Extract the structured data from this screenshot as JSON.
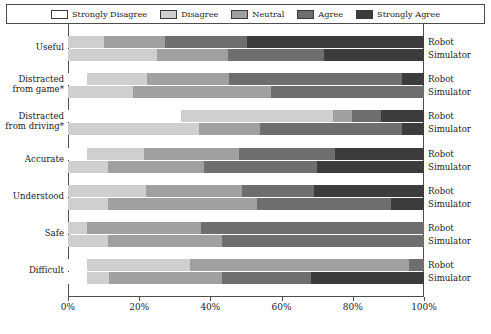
{
  "chart_data": {
    "type": "bar",
    "subtype": "stacked-horizontal-likert",
    "title": "",
    "xlabel": "",
    "ylabel": "",
    "xlim": [
      0,
      100
    ],
    "xticks": [
      "0%",
      "20%",
      "40%",
      "60%",
      "80%",
      "100%"
    ],
    "xtick_values": [
      0,
      20,
      40,
      60,
      80,
      100
    ],
    "grid": false,
    "legend": {
      "position": "top",
      "entries": [
        {
          "label": "Strongly Disagree",
          "color": "#ffffff",
          "key": "sd"
        },
        {
          "label": "Disagree",
          "color": "#cfcfcf",
          "key": "d"
        },
        {
          "label": "Neutral",
          "color": "#a0a0a0",
          "key": "n"
        },
        {
          "label": "Agree",
          "color": "#6e6e6e",
          "key": "a"
        },
        {
          "label": "Strongly Agree",
          "color": "#3c3c3c",
          "key": "sa"
        }
      ]
    },
    "categories": [
      "Useful",
      "Distracted from game*",
      "Distracted from driving*",
      "Accurate",
      "Understood",
      "Safe",
      "Difficult"
    ],
    "series_names": [
      "Robot",
      "Simulator"
    ],
    "groups": [
      {
        "category": "Useful",
        "label_line1": "Useful",
        "label_line2": "",
        "bars": [
          {
            "series": "Robot",
            "values": [
              0,
              10,
              17,
              23,
              50
            ]
          },
          {
            "series": "Simulator",
            "values": [
              0,
              25,
              20,
              27,
              28
            ]
          }
        ]
      },
      {
        "category": "Distracted from game*",
        "label_line1": "Distracted",
        "label_line2": "from game*",
        "bars": [
          {
            "series": "Robot",
            "values": [
              5,
              17,
              23,
              49,
              6
            ]
          },
          {
            "series": "Simulator",
            "values": [
              0,
              18,
              39,
              43,
              0
            ]
          }
        ]
      },
      {
        "category": "Distracted from driving*",
        "label_line1": "Distracted",
        "label_line2": "from driving*",
        "bars": [
          {
            "series": "Robot",
            "values": [
              32,
              43,
              5,
              8,
              12
            ]
          },
          {
            "series": "Simulator",
            "values": [
              0,
              37,
              17,
              40,
              6
            ]
          }
        ]
      },
      {
        "category": "Accurate",
        "label_line1": "Accurate",
        "label_line2": "",
        "bars": [
          {
            "series": "Robot",
            "values": [
              5,
              16,
              27,
              27,
              25
            ]
          },
          {
            "series": "Simulator",
            "values": [
              0,
              11,
              27,
              32,
              30
            ]
          }
        ]
      },
      {
        "category": "Understood",
        "label_line1": "Understood",
        "label_line2": "",
        "bars": [
          {
            "series": "Robot",
            "values": [
              0,
              22,
              27,
              20,
              31
            ]
          },
          {
            "series": "Simulator",
            "values": [
              0,
              11,
              42,
              38,
              9
            ]
          }
        ]
      },
      {
        "category": "Safe",
        "label_line1": "Safe",
        "label_line2": "",
        "bars": [
          {
            "series": "Robot",
            "values": [
              0,
              5,
              32,
              63,
              0
            ]
          },
          {
            "series": "Simulator",
            "values": [
              0,
              11,
              32,
              57,
              0
            ]
          }
        ]
      },
      {
        "category": "Difficult",
        "label_line1": "Difficult",
        "label_line2": "",
        "bars": [
          {
            "series": "Robot",
            "values": [
              5,
              29,
              62,
              4,
              0
            ]
          },
          {
            "series": "Simulator",
            "values": [
              5,
              6,
              32,
              25,
              32
            ]
          }
        ]
      }
    ]
  }
}
